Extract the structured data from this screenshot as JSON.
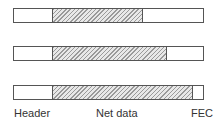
{
  "diagram": {
    "title": "",
    "frames": [
      {
        "header_end": 52,
        "net_end": 142,
        "top": 8
      },
      {
        "header_end": 52,
        "net_end": 166,
        "top": 46
      },
      {
        "header_end": 52,
        "net_end": 192,
        "top": 85
      }
    ],
    "labels": {
      "header": "Header",
      "net_data": "Net data",
      "fec": "FEC"
    },
    "colors": {
      "border": "#555555",
      "hatch": "#9a9a9a",
      "background": "#ffffff"
    }
  }
}
